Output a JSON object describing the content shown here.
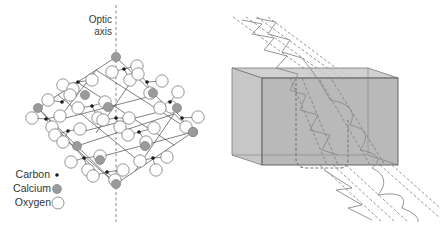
{
  "figure": {
    "left_panel": {
      "title": "Calcite crystal structure",
      "axis_label_line1": "Optic",
      "axis_label_line2": "axis",
      "legend": [
        {
          "label": "Carbon",
          "symbol": "small-black-dot",
          "color": "#1a1a1a"
        },
        {
          "label": "Calcium",
          "symbol": "gray-filled-circle",
          "color": "#9a9a9a"
        },
        {
          "label": "Oxygen",
          "symbol": "open-white-circle",
          "color": "#ffffff"
        }
      ]
    },
    "right_panel": {
      "title": "Double refraction through a birefringent crystal block",
      "crystal_color": "#a9a9a9",
      "beam_color": "#6e6e6e"
    }
  }
}
